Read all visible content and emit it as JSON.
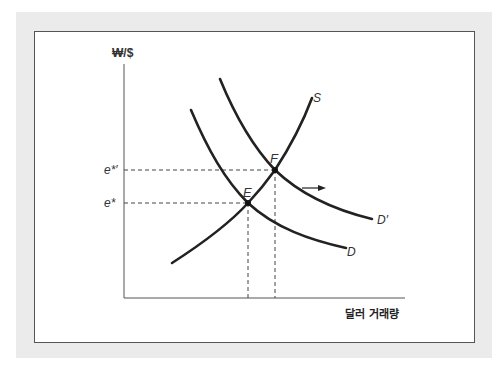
{
  "figure": {
    "y_axis_label": "₩/$",
    "x_axis_label": "달러 거래량",
    "curves": {
      "supply": {
        "label": "S"
      },
      "demand": {
        "label": "D"
      },
      "demand_shifted": {
        "label": "D′"
      }
    },
    "equilibria": {
      "initial": {
        "label": "E",
        "price_label": "e*"
      },
      "new": {
        "label": "F",
        "price_label": "e*′"
      }
    },
    "shift_arrow": {
      "direction": "right"
    }
  },
  "colors": {
    "panel_background": "#ebebeb",
    "frame_border": "#555555",
    "curve_stroke": "#222222",
    "axis_stroke": "#555555",
    "dashed_guides": "#444444"
  }
}
